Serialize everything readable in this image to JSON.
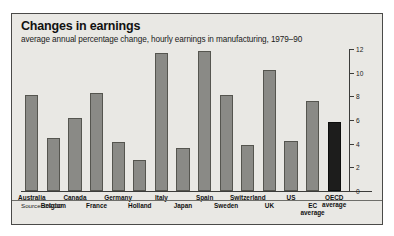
{
  "chart_data": {
    "type": "bar",
    "title": "Changes in earnings",
    "subtitle": "average annual percentage change, hourly earnings in manufacturing, 1979–90",
    "source": "Source: OECD",
    "xlabel": "",
    "ylabel": "",
    "ylim": [
      0,
      12
    ],
    "yticks": [
      0,
      2,
      4,
      6,
      8,
      10,
      12
    ],
    "axis_position": "right",
    "grid": false,
    "legend": "none",
    "categories": [
      "Australia",
      "Belgium",
      "Canada",
      "France",
      "Germany",
      "Holland",
      "Italy",
      "Japan",
      "Spain",
      "Sweden",
      "Switzerland",
      "UK",
      "US",
      "EC average",
      "OECD average"
    ],
    "values": [
      8.1,
      4.5,
      6.2,
      8.3,
      4.1,
      2.6,
      11.7,
      3.6,
      11.8,
      8.1,
      3.9,
      10.2,
      4.2,
      7.6,
      5.8
    ],
    "highlight_index": 14,
    "colors": {
      "bar": "#8a8a86",
      "bar_border": "#55554f",
      "bar_highlight": "#1d1d1c",
      "background": "#e9e8e4",
      "frame": "#4a4a48",
      "text": "#111111"
    }
  }
}
